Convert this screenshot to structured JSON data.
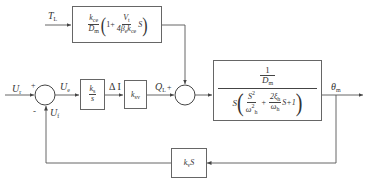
{
  "diagram": {
    "type": "control-system block diagram",
    "signals": {
      "load_torque": "T",
      "load_torque_sub": "L",
      "reference": "U",
      "reference_sub": "r",
      "error": "U",
      "error_sub": "e",
      "current": "Δ I",
      "flow": "Q",
      "flow_sub": "L",
      "flow_sign": "+",
      "output": "θ",
      "output_sub": "m",
      "feedback": "U",
      "feedback_sub": "f",
      "sum1_plus": "+",
      "sum1_minus": "-"
    },
    "blocks": {
      "disturbance": {
        "k": "k",
        "k_sub": "ce",
        "D": "D",
        "D_sub": "m",
        "one_plus": "1+",
        "V": "V",
        "V_sub": "t",
        "den_4beta": "4β",
        "beta_sub": "e",
        "den_k": "k",
        "den_k_sub": "ce",
        "S": "S"
      },
      "controller": {
        "num": "k",
        "num_sub": "s",
        "den": "s"
      },
      "valve": {
        "k": "k",
        "k_sub": "sv"
      },
      "plant": {
        "num_1": "1",
        "num_D": "D",
        "num_D_sub": "m",
        "S": "S",
        "S2": "S",
        "S2_sup": "2",
        "omega": "ω",
        "omega_sub": "h",
        "omega2_sup": "2",
        "plus": "+",
        "two_xi": "2ξ",
        "xi_sub": "h",
        "omega2": "ω",
        "omega2_sub": "h",
        "tail": "S+1"
      },
      "feedback": {
        "k": "k",
        "k_sub": "v",
        "S": "S"
      }
    },
    "colors": {
      "line": "#555555",
      "background": "#ffffff"
    }
  }
}
